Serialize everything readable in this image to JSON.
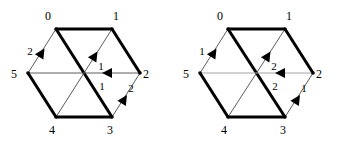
{
  "figure": {
    "name": "two-hexagon-directed-graph-diagram",
    "background_color": "#ffffff",
    "width": 341,
    "height": 146,
    "stroke_colors": {
      "bold": "#000000",
      "thin": "#4a4a4a",
      "gray": "#9a9a9a",
      "label": "#000000"
    },
    "stroke_widths": {
      "bold": 3.0,
      "thin": 0.9
    }
  },
  "hexagons": [
    {
      "id": "left-hexagon",
      "center": {
        "x": 84,
        "y": 73
      },
      "vertices": [
        {
          "id": "v0",
          "label": "0",
          "x": 56,
          "y": 29,
          "label_x": 48,
          "label_y": 20
        },
        {
          "id": "v1",
          "label": "1",
          "x": 112,
          "y": 29,
          "label_x": 116,
          "label_y": 20
        },
        {
          "id": "v2",
          "label": "2",
          "x": 140,
          "y": 73,
          "label_x": 146,
          "label_y": 78
        },
        {
          "id": "v3",
          "label": "3",
          "x": 112,
          "y": 117,
          "label_x": 110,
          "label_y": 134
        },
        {
          "id": "v4",
          "label": "4",
          "x": 56,
          "y": 117,
          "label_x": 52,
          "label_y": 134
        },
        {
          "id": "v5",
          "label": "5",
          "x": 28,
          "y": 73,
          "label_x": 14,
          "label_y": 78
        }
      ],
      "edges": [
        {
          "id": "e-0-1",
          "from": "v0",
          "to": "v1",
          "weight": "bold"
        },
        {
          "id": "e-1-2",
          "from": "v1",
          "to": "v2",
          "weight": "bold"
        },
        {
          "id": "e-2-3",
          "from": "v2",
          "to": "v3",
          "weight": "thin"
        },
        {
          "id": "e-3-4",
          "from": "v3",
          "to": "v4",
          "weight": "bold"
        },
        {
          "id": "e-4-5",
          "from": "v4",
          "to": "v5",
          "weight": "bold"
        },
        {
          "id": "e-5-0",
          "from": "v5",
          "to": "v0",
          "weight": "thin"
        },
        {
          "id": "d-0-3",
          "from": "v0",
          "to": "v3",
          "weight": "bold"
        },
        {
          "id": "d-1-4",
          "from": "v1",
          "to": "v4",
          "weight": "thin"
        },
        {
          "id": "d-2-5",
          "from": "v2",
          "to": "v5",
          "weight": "thin"
        }
      ],
      "arrows": [
        {
          "id": "a-5-0",
          "from": "v5",
          "to": "v0",
          "label": "2",
          "tip": {
            "x": 44.5,
            "y": 48.5
          },
          "angle": -57.5,
          "label_x": 30,
          "label_y": 55
        },
        {
          "id": "a-4-1",
          "from": "v4",
          "to": "v1",
          "label": "1",
          "tip": {
            "x": 97.5,
            "y": 51.5
          },
          "angle": -57.5,
          "label_x": 101,
          "label_y": 70
        },
        {
          "id": "a-2-5",
          "from": "v2",
          "to": "v5",
          "label": "1",
          "tip": {
            "x": 102,
            "y": 73
          },
          "angle": 180,
          "label_x": 102,
          "label_y": 90
        },
        {
          "id": "a-3-2",
          "from": "v3",
          "to": "v2",
          "label": "2",
          "tip": {
            "x": 127,
            "y": 95
          },
          "angle": -57.5,
          "label_x": 131,
          "label_y": 92
        }
      ]
    },
    {
      "id": "right-hexagon",
      "center": {
        "x": 256,
        "y": 73
      },
      "vertices": [
        {
          "id": "v0",
          "label": "0",
          "x": 228,
          "y": 29,
          "label_x": 220,
          "label_y": 20
        },
        {
          "id": "v1",
          "label": "1",
          "x": 285,
          "y": 29,
          "label_x": 289,
          "label_y": 20
        },
        {
          "id": "v2",
          "label": "2",
          "x": 313,
          "y": 73,
          "label_x": 319,
          "label_y": 78
        },
        {
          "id": "v3",
          "label": "3",
          "x": 285,
          "y": 117,
          "label_x": 283,
          "label_y": 134
        },
        {
          "id": "v4",
          "label": "4",
          "x": 228,
          "y": 117,
          "label_x": 224,
          "label_y": 134
        },
        {
          "id": "v5",
          "label": "5",
          "x": 200,
          "y": 73,
          "label_x": 186,
          "label_y": 78
        }
      ],
      "edges": [
        {
          "id": "e-0-1",
          "from": "v0",
          "to": "v1",
          "weight": "bold"
        },
        {
          "id": "e-1-2",
          "from": "v1",
          "to": "v2",
          "weight": "bold"
        },
        {
          "id": "e-2-3",
          "from": "v2",
          "to": "v3",
          "weight": "thin"
        },
        {
          "id": "e-3-4",
          "from": "v3",
          "to": "v4",
          "weight": "bold"
        },
        {
          "id": "e-4-5",
          "from": "v4",
          "to": "v5",
          "weight": "bold"
        },
        {
          "id": "e-5-0",
          "from": "v5",
          "to": "v0",
          "weight": "thin"
        },
        {
          "id": "d-0-3",
          "from": "v0",
          "to": "v3",
          "weight": "bold"
        },
        {
          "id": "d-1-4",
          "from": "v1",
          "to": "v4",
          "weight": "thin"
        },
        {
          "id": "d-2-5",
          "from": "v2",
          "to": "v5",
          "weight": "gray"
        }
      ],
      "arrows": [
        {
          "id": "a-5-0",
          "from": "v5",
          "to": "v0",
          "label": "1",
          "tip": {
            "x": 216.5,
            "y": 48.5
          },
          "angle": -57.5,
          "label_x": 202,
          "label_y": 55
        },
        {
          "id": "a-4-1",
          "from": "v4",
          "to": "v1",
          "label": "2",
          "tip": {
            "x": 270.5,
            "y": 51.5
          },
          "angle": -57.5,
          "label_x": 274,
          "label_y": 70
        },
        {
          "id": "a-2-5",
          "from": "v2",
          "to": "v5",
          "label": "2",
          "tip": {
            "x": 275,
            "y": 73
          },
          "angle": 180,
          "label_x": 275,
          "label_y": 90
        },
        {
          "id": "a-3-2",
          "from": "v3",
          "to": "v2",
          "label": "1",
          "tip": {
            "x": 300,
            "y": 95
          },
          "angle": -57.5,
          "label_x": 304,
          "label_y": 92
        }
      ]
    }
  ]
}
